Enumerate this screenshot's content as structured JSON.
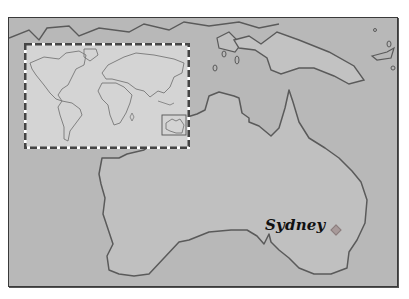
{
  "map": {
    "region": "Australia",
    "inset": {
      "description": "World map inset with Australia highlighted",
      "highlight_region": "Australia"
    },
    "cities": [
      {
        "name": "Sydney",
        "marker": "diamond-marker-icon"
      }
    ],
    "colors": {
      "ocean": "#b8b8b8",
      "land": "#c0c0c0",
      "coastline": "#5a5a5a",
      "inset_background": "#d4d4d4",
      "inset_border": "#444444",
      "label": "#111111",
      "marker": "#a89a9a"
    }
  }
}
